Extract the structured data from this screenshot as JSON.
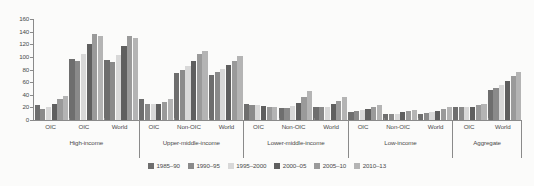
{
  "chart_data": {
    "type": "bar",
    "title": "",
    "subtitle": "",
    "xlabel": "",
    "ylabel": "",
    "ylim": [
      0,
      160
    ],
    "y_ticks": [
      0,
      20,
      40,
      60,
      80,
      100,
      120,
      140,
      160
    ],
    "grid": false,
    "legend_position": "bottom",
    "series": [
      {
        "name": "1985–90",
        "color": "#6e6e6e"
      },
      {
        "name": "1990–95",
        "color": "#8a8a8a"
      },
      {
        "name": "1995–2000",
        "color": "#d8d8d8"
      },
      {
        "name": "2000–05",
        "color": "#5f5f5f"
      },
      {
        "name": "2005–10",
        "color": "#9a9a9a"
      },
      {
        "name": "2010–13",
        "color": "#b4b4b4"
      }
    ],
    "groups": [
      {
        "label": "High-income",
        "subgroups": [
          {
            "label": "OIC",
            "values": [
              23,
              18,
              21,
              26,
              33,
              38
            ]
          },
          {
            "label": "OIC",
            "values": [
              97,
              93,
              104,
              120,
              136,
              133
            ]
          },
          {
            "label": "World",
            "values": [
              95,
              92,
              103,
              117,
              133,
              130
            ]
          }
        ]
      },
      {
        "label": "Upper-middle-income",
        "subgroups": [
          {
            "label": "OIC",
            "values": [
              34,
              26,
              25,
              26,
              28,
              34
            ]
          },
          {
            "label": "Non-OIC",
            "values": [
              74,
              80,
              86,
              94,
              105,
              109
            ]
          },
          {
            "label": "World",
            "values": [
              71,
              76,
              81,
              87,
              94,
              101
            ]
          }
        ]
      },
      {
        "label": "Lower-middle-income",
        "subgroups": [
          {
            "label": "OIC",
            "values": [
              25,
              24,
              23,
              22,
              21,
              21
            ]
          },
          {
            "label": "Non-OIC",
            "values": [
              19,
              19,
              22,
              27,
              36,
              46
            ]
          },
          {
            "label": "World",
            "values": [
              20,
              20,
              21,
              25,
              30,
              36
            ]
          }
        ]
      },
      {
        "label": "Low-income",
        "subgroups": [
          {
            "label": "OIC",
            "values": [
              12,
              14,
              16,
              18,
              21,
              23
            ]
          },
          {
            "label": "Non-OIC",
            "values": [
              9,
              9,
              10,
              12,
              14,
              16
            ]
          },
          {
            "label": "World",
            "values": [
              10,
              11,
              12,
              14,
              17,
              20
            ]
          }
        ]
      },
      {
        "label": "Aggregate",
        "subgroups": [
          {
            "label": "OIC",
            "values": [
              21,
              20,
              20,
              21,
              23,
              25
            ]
          },
          {
            "label": "World",
            "values": [
              47,
              51,
              56,
              62,
              70,
              76
            ]
          }
        ]
      }
    ]
  }
}
